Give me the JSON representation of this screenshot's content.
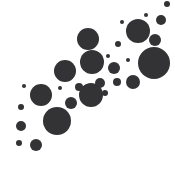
{
  "figure": {
    "name": "diagonal-bubble-scatter",
    "width": 175,
    "height": 170,
    "background_color": "#ffffff",
    "marker_color": "#333336"
  },
  "chart_data": {
    "type": "scatter",
    "title": "",
    "subtitle": "",
    "xlabel": "",
    "ylabel": "",
    "xlim": [
      0,
      175
    ],
    "ylim": [
      0,
      170
    ],
    "grid": false,
    "axes_visible": false,
    "legend": null,
    "legend_position": "none",
    "marker": "circle",
    "marker_color": "#333336",
    "background_color": "#ffffff",
    "point_count": 29,
    "size_encoding": "radius",
    "points": [
      {
        "x": 167,
        "y": 4,
        "r": 3
      },
      {
        "x": 161,
        "y": 20,
        "r": 5
      },
      {
        "x": 155,
        "y": 40,
        "r": 6
      },
      {
        "x": 138,
        "y": 31,
        "r": 12
      },
      {
        "x": 154,
        "y": 63,
        "r": 16
      },
      {
        "x": 122,
        "y": 22,
        "r": 2
      },
      {
        "x": 118,
        "y": 44,
        "r": 3
      },
      {
        "x": 114,
        "y": 68,
        "r": 6
      },
      {
        "x": 117,
        "y": 82,
        "r": 4
      },
      {
        "x": 133,
        "y": 82,
        "r": 7
      },
      {
        "x": 88,
        "y": 39,
        "r": 11
      },
      {
        "x": 92,
        "y": 62,
        "r": 12
      },
      {
        "x": 65,
        "y": 71,
        "r": 11
      },
      {
        "x": 91,
        "y": 95,
        "r": 12
      },
      {
        "x": 105,
        "y": 93,
        "r": 3
      },
      {
        "x": 71,
        "y": 103,
        "r": 6
      },
      {
        "x": 79,
        "y": 87,
        "r": 4
      },
      {
        "x": 41,
        "y": 95,
        "r": 11
      },
      {
        "x": 24,
        "y": 86,
        "r": 2
      },
      {
        "x": 57,
        "y": 121,
        "r": 14
      },
      {
        "x": 21,
        "y": 107,
        "r": 3
      },
      {
        "x": 21,
        "y": 126,
        "r": 5
      },
      {
        "x": 19,
        "y": 143,
        "r": 3
      },
      {
        "x": 36,
        "y": 145,
        "r": 6
      },
      {
        "x": 100,
        "y": 83,
        "r": 5
      },
      {
        "x": 128,
        "y": 60,
        "r": 2
      },
      {
        "x": 146,
        "y": 15,
        "r": 2
      },
      {
        "x": 108,
        "y": 56,
        "r": 2
      },
      {
        "x": 60,
        "y": 88,
        "r": 2
      }
    ]
  }
}
